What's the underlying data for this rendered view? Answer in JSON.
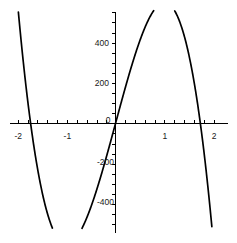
{
  "chart_data": {
    "type": "line",
    "title": "",
    "subtitle": "",
    "xlabel": "",
    "ylabel": "",
    "xlim": [
      -2.12,
      2.12
    ],
    "ylim": [
      -520,
      560
    ],
    "grid": false,
    "legend": null,
    "axes_style": "centered-cross",
    "x_ticks_labeled": [
      {
        "value": -2,
        "label": "-2"
      },
      {
        "value": -1,
        "label": "-1"
      },
      {
        "value": 0,
        "label": "0"
      },
      {
        "value": 1,
        "label": "1"
      },
      {
        "value": 2,
        "label": "2"
      }
    ],
    "x_tick_minor_step": 0.2,
    "y_ticks_labeled": [
      {
        "value": 400,
        "label": "400"
      },
      {
        "value": 200,
        "label": "200"
      },
      {
        "value": -200,
        "label": "-200"
      },
      {
        "value": -400,
        "label": "-400"
      }
    ],
    "y_tick_minor_step": 50,
    "series": [
      {
        "name": "y = -300x^3 + 900x",
        "color": "#000000",
        "x": [
          -2.0,
          -1.9,
          -1.8,
          -1.7,
          -1.6,
          -1.5,
          -1.4,
          -1.3,
          -1.2,
          -1.1,
          -1.0,
          -0.9,
          -0.8,
          -0.7,
          -0.6,
          -0.5,
          -0.4,
          -0.3,
          -0.2,
          -0.1,
          0.0,
          0.1,
          0.2,
          0.3,
          0.4,
          0.5,
          0.6,
          0.7,
          0.8,
          0.9,
          1.0,
          1.1,
          1.2,
          1.3,
          1.4,
          1.5,
          1.6,
          1.7,
          1.8,
          1.9,
          2.0
        ],
        "y": [
          600,
          347.7,
          129.6,
          -56.1,
          -211.2,
          -337.5,
          -436.8,
          -510.9,
          -561.6,
          -590.7,
          -600,
          -591.3,
          -566.4,
          -527.1,
          -475.2,
          -412.5,
          -340.8,
          -261.9,
          -177.6,
          -89.7,
          0,
          89.7,
          177.6,
          261.9,
          340.8,
          412.5,
          475.2,
          527.1,
          566.4,
          591.3,
          600,
          590.7,
          561.6,
          510.9,
          436.8,
          337.5,
          211.2,
          56.1,
          -129.6,
          -347.7,
          -600
        ],
        "roots": [
          -1.732,
          0,
          1.732
        ],
        "local_max": {
          "x": 1.0,
          "y": 600
        },
        "local_min": {
          "x": -1.0,
          "y": -600
        }
      }
    ],
    "visible_peak_approx": {
      "x": 1.0,
      "y": 410
    },
    "visible_trough_approx": {
      "x": -1.0,
      "y": -410
    }
  }
}
